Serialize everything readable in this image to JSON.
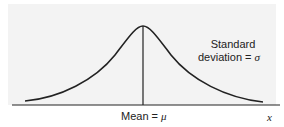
{
  "diagram": {
    "sd_label_line1": "Standard",
    "sd_label_line2_text": "deviation = ",
    "sd_symbol": "σ",
    "mean_label_text": "Mean = ",
    "mean_symbol": "μ",
    "x_axis_label": "x",
    "colors": {
      "curve": "#222222",
      "axis": "#222222",
      "background": "#f3f3f3"
    }
  }
}
